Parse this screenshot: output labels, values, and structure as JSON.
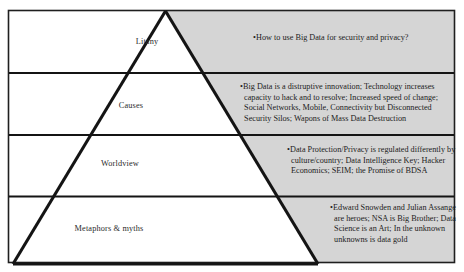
{
  "diagram": {
    "type": "causal-layered-analysis-pyramid",
    "colors": {
      "band_fill": "#d5d5d5",
      "pyramid_fill": "#ffffff",
      "stroke": "#1a1a1a",
      "text": "#1c1c1c"
    },
    "layers": [
      {
        "id": "litany",
        "label": "Litany",
        "bullet": "•",
        "body": "How to use Big Data for security and privacy?"
      },
      {
        "id": "causes",
        "label": "Causes",
        "bullet": "•",
        "body": "Big Data is a distruptive innovation; Technology increases capacity to hack and to resolve; Increased speed of change; Social Networks, Mobile, Connectivity but Disconnected Security Silos; Wapons of Mass Data Destruction"
      },
      {
        "id": "worldview",
        "label": "Worldview",
        "bullet": "•",
        "body": "Data Protection/Privacy is regulated differently by culture/country; Data Intelligence Key; Hacker Economics; SEIM; the Promise of BDSA"
      },
      {
        "id": "metaphors",
        "label": "Metaphors & myths",
        "bullet": "•",
        "body": "Edward Snowden and Julian Assange are heroes; NSA is Big Brother; Data Science is an Art; In the unknown unknowns is data gold"
      }
    ]
  }
}
